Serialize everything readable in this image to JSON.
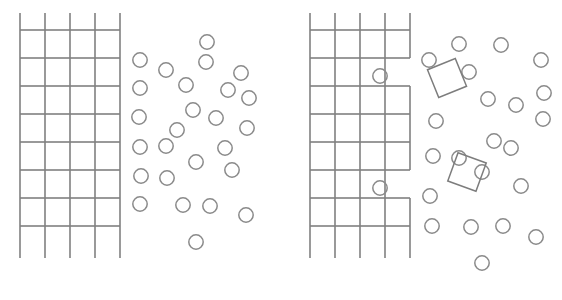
{
  "figure": {
    "background_color": "#ffffff",
    "line_color": "#808080",
    "circle_color": "#8a8a8a",
    "square_color": "#7d7d7d",
    "width": 562,
    "height": 300,
    "panel_count": 2
  },
  "caption": {
    "text": "",
    "color": "#b9b9b9"
  },
  "panels": [
    {
      "id": "panel-left",
      "name": "left-panel",
      "label": "",
      "origin_x": 0,
      "lattice": {
        "name": "lattice-grid-left",
        "x_lines": [
          20,
          45,
          70,
          95,
          120
        ],
        "y_lines": [
          30,
          58,
          86,
          114,
          142,
          170,
          198,
          226
        ],
        "overhang_top": 17,
        "overhang_bottom": 32,
        "overhang_left": 0,
        "overhang_right": 0,
        "columns": 4,
        "rows": 7,
        "notches": []
      },
      "particles": {
        "name": "particle-cloud-left",
        "radius": 7.2,
        "count": 26,
        "points": [
          [
            207,
            42
          ],
          [
            140,
            60
          ],
          [
            166,
            70
          ],
          [
            241,
            73
          ],
          [
            186,
            85
          ],
          [
            228,
            90
          ],
          [
            140,
            88
          ],
          [
            193,
            110
          ],
          [
            216,
            118
          ],
          [
            139,
            117
          ],
          [
            177,
            130
          ],
          [
            247,
            128
          ],
          [
            249,
            98
          ],
          [
            166,
            146
          ],
          [
            140,
            147
          ],
          [
            225,
            148
          ],
          [
            196,
            162
          ],
          [
            141,
            176
          ],
          [
            167,
            178
          ],
          [
            232,
            170
          ],
          [
            140,
            204
          ],
          [
            183,
            205
          ],
          [
            210,
            206
          ],
          [
            246,
            215
          ],
          [
            196,
            242
          ],
          [
            206,
            62
          ]
        ]
      },
      "inclusions": {
        "name": "inclusion-squares-left",
        "count": 0,
        "items": []
      }
    },
    {
      "id": "panel-right",
      "name": "right-panel",
      "label": "",
      "origin_x": 281,
      "lattice": {
        "name": "lattice-grid-right",
        "x_lines": [
          29,
          54,
          79,
          104,
          129
        ],
        "y_lines": [
          30,
          58,
          86,
          114,
          142,
          170,
          198,
          226
        ],
        "overhang_top": 17,
        "overhang_bottom": 32,
        "overhang_left": 0,
        "overhang_right": 0,
        "columns": 4,
        "rows": 7,
        "notches": [
          {
            "name": "lattice-notch-upper",
            "col": 3,
            "row": 1
          },
          {
            "name": "lattice-notch-lower",
            "col": 3,
            "row": 5
          }
        ]
      },
      "particles": {
        "name": "particle-cloud-right",
        "radius": 7.2,
        "count": 24,
        "points": [
          [
            99,
            76
          ],
          [
            99,
            188
          ],
          [
            148,
            60
          ],
          [
            188,
            72
          ],
          [
            220,
            45
          ],
          [
            207,
            99
          ],
          [
            235,
            105
          ],
          [
            263,
            93
          ],
          [
            155,
            121
          ],
          [
            152,
            156
          ],
          [
            213,
            141
          ],
          [
            201,
            172
          ],
          [
            149,
            196
          ],
          [
            230,
            148
          ],
          [
            262,
            119
          ],
          [
            240,
            186
          ],
          [
            151,
            226
          ],
          [
            190,
            227
          ],
          [
            222,
            226
          ],
          [
            255,
            237
          ],
          [
            201,
            263
          ],
          [
            178,
            158
          ],
          [
            178,
            44
          ],
          [
            260,
            60
          ]
        ]
      },
      "inclusions": {
        "name": "inclusion-squares-right",
        "count": 2,
        "items": [
          {
            "name": "inclusion-square-upper",
            "cx": 166,
            "cy": 78,
            "size": 30,
            "rotation": -22
          },
          {
            "name": "inclusion-square-lower",
            "cx": 186,
            "cy": 172,
            "size": 30,
            "rotation": 20
          }
        ]
      }
    }
  ]
}
